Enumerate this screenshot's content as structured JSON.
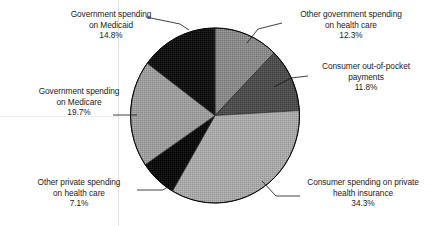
{
  "chart_data": {
    "type": "pie",
    "title": "",
    "subtitle": "",
    "xlabel": "",
    "ylabel": "",
    "legend_position": "none",
    "grid": false,
    "units": "percent",
    "start_angle_deg": 0,
    "direction": "clockwise",
    "categories": [
      "Other government spending on health care",
      "Consumer out-of-pocket payments",
      "Consumer spending on private health insurance",
      "Other private spending on health care",
      "Government spending on Medicare",
      "Government spending on Medicaid"
    ],
    "values": [
      12.3,
      11.8,
      34.3,
      7.1,
      19.7,
      14.8
    ],
    "slices": [
      {
        "id": "other-government-spending",
        "label_lines": [
          "Other government spending",
          "on health care"
        ],
        "value_label": "12.3%",
        "value": 12.3,
        "fill": "#8a8a8a",
        "start_deg": 0.0,
        "end_deg": 44.28
      },
      {
        "id": "consumer-out-of-pocket",
        "label_lines": [
          "Consumer out-of-pocket",
          "payments"
        ],
        "value_label": "11.8%",
        "value": 11.8,
        "fill": "#4f4f4f",
        "start_deg": 44.28,
        "end_deg": 86.76
      },
      {
        "id": "consumer-private-insurance",
        "label_lines": [
          "Consumer spending on private",
          "health insurance"
        ],
        "value_label": "34.3%",
        "value": 34.3,
        "fill": "#a8a8a8",
        "start_deg": 86.76,
        "end_deg": 210.24
      },
      {
        "id": "other-private-spending",
        "label_lines": [
          "Other private spending",
          "on health care"
        ],
        "value_label": "7.1%",
        "value": 7.1,
        "fill": "#0f0f0f",
        "start_deg": 210.24,
        "end_deg": 235.8
      },
      {
        "id": "government-spending-medicare",
        "label_lines": [
          "Government spending",
          "on Medicare"
        ],
        "value_label": "19.7%",
        "value": 19.7,
        "fill": "#9d9d9d",
        "start_deg": 235.8,
        "end_deg": 306.72
      },
      {
        "id": "government-spending-medicaid",
        "label_lines": [
          "Government spending",
          "on Medicaid"
        ],
        "value_label": "14.8%",
        "value": 14.8,
        "fill": "#141414",
        "start_deg": 306.72,
        "end_deg": 360.0
      }
    ],
    "total": 100.0,
    "background_color": "#ffffff",
    "outline_color": "#000000"
  },
  "labels": {
    "government_medicaid": {
      "line1": "Government spending",
      "line2": "on Medicaid",
      "percent": "14.8%"
    },
    "other_government": {
      "line1": "Other government spending",
      "line2": "on health care",
      "percent": "12.3%"
    },
    "consumer_out_of_pocket": {
      "line1": "Consumer out-of-pocket",
      "line2": "payments",
      "percent": "11.8%"
    },
    "government_medicare": {
      "line1": "Government spending",
      "line2": "on Medicare",
      "percent": "19.7%"
    },
    "other_private": {
      "line1": "Other private spending",
      "line2": "on health care",
      "percent": "7.1%"
    },
    "consumer_private_insurance": {
      "line1": "Consumer spending on private",
      "line2": "health insurance",
      "percent": "34.3%"
    }
  }
}
